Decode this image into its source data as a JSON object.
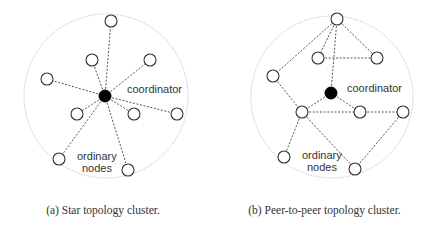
{
  "figure": {
    "panels": [
      {
        "id": "a",
        "caption": "(a) Star topology cluster.",
        "coordinator_label": "coordinator",
        "ordinary_label_line1": "ordinary",
        "ordinary_label_line2": "nodes",
        "topology": "star"
      },
      {
        "id": "b",
        "caption": "(b) Peer-to-peer topology cluster.",
        "coordinator_label": "coordinator",
        "ordinary_label_line1": "ordinary",
        "ordinary_label_line2": "nodes",
        "topology": "peer-to-peer"
      }
    ],
    "colors": {
      "coordinator_fill": "#000000",
      "node_stroke": "#333333",
      "edge": "#555555",
      "boundary": "#bdbdbd"
    }
  }
}
